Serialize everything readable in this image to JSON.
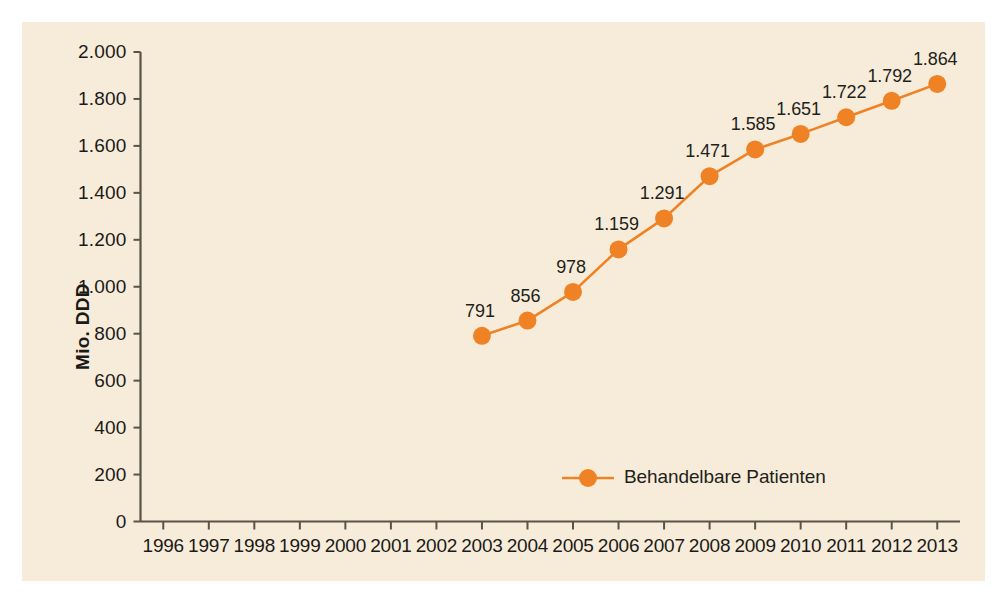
{
  "chart_data": {
    "type": "line",
    "title": "",
    "subtitle": "",
    "xlabel": "",
    "ylabel": "Mio. DDD",
    "categories": [
      "1996",
      "1997",
      "1998",
      "1999",
      "2000",
      "2001",
      "2002",
      "2003",
      "2004",
      "2005",
      "2006",
      "2007",
      "2008",
      "2009",
      "2010",
      "2011",
      "2012",
      "2013"
    ],
    "xtick_labels": [
      "1996",
      "1997",
      "1998",
      "1999",
      "2000",
      "2001",
      "2002",
      "2003",
      "2004",
      "2005",
      "2006",
      "2007",
      "2008",
      "2009",
      "2010",
      "2011",
      "2012",
      "2013"
    ],
    "ytick_labels": [
      "0",
      "200",
      "400",
      "600",
      "800",
      "1.000",
      "1.200",
      "1.400",
      "1.600",
      "1.800",
      "2.000"
    ],
    "ytick_values": [
      0,
      200,
      400,
      600,
      800,
      1000,
      1200,
      1400,
      1600,
      1800,
      2000
    ],
    "ylim": [
      0,
      2000
    ],
    "grid": false,
    "legend_position": "inside-bottom-center",
    "series": [
      {
        "name": "Behandelbare Patienten",
        "color": "#f08226",
        "x": [
          "2003",
          "2004",
          "2005",
          "2006",
          "2007",
          "2008",
          "2009",
          "2010",
          "2011",
          "2012",
          "2013"
        ],
        "values": [
          791,
          856,
          978,
          1159,
          1291,
          1471,
          1585,
          1651,
          1722,
          1792,
          1864
        ],
        "point_labels": [
          "791",
          "856",
          "978",
          "1.159",
          "1.291",
          "1.471",
          "1.585",
          "1.651",
          "1.722",
          "1.792",
          "1.864"
        ]
      }
    ],
    "legend": [
      {
        "label": "Behandelbare Patienten",
        "color": "#f08226",
        "marker": "circle"
      }
    ],
    "colors": {
      "panel_background": "#f7ecd9",
      "figure_background": "#ffffff",
      "series_orange": "#f08226",
      "axis": "#5a534a",
      "text": "#1b1a18"
    }
  }
}
